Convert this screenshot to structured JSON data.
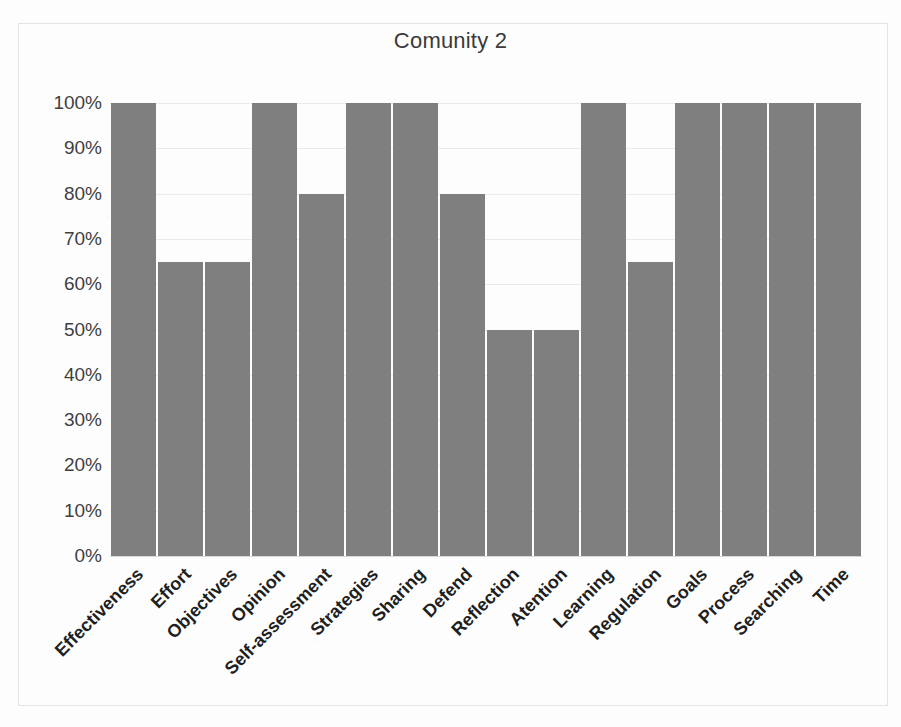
{
  "chart_data": {
    "type": "bar",
    "title": "Comunity 2",
    "xlabel": "",
    "ylabel": "",
    "ylim": [
      0,
      100
    ],
    "grid": true,
    "legend": "none",
    "orientation": "vertical",
    "bar_color": "#7f7f7f",
    "categories": [
      "Effectiveness",
      "Effort",
      "Objectives",
      "Opinion",
      "Self-assessment",
      "Strategies",
      "Sharing",
      "Defend",
      "Reflection",
      "Atention",
      "Learning",
      "Regulation",
      "Goals",
      "Process",
      "Searching",
      "Time"
    ],
    "values": [
      100,
      65,
      65,
      100,
      80,
      100,
      100,
      80,
      50,
      50,
      100,
      65,
      100,
      100,
      100,
      100
    ],
    "value_labels": [
      "100%",
      "65%",
      "65%",
      "100%",
      "80%",
      "100%",
      "100%",
      "80%",
      "50%",
      "50%",
      "100%",
      "65%",
      "100%",
      "100%",
      "100%",
      "100%"
    ],
    "ytick_values": [
      100,
      90,
      80,
      70,
      60,
      50,
      40,
      30,
      20,
      10,
      0
    ],
    "ytick_labels": [
      "100%",
      "90%",
      "80%",
      "70%",
      "60%",
      "50%",
      "40%",
      "30%",
      "20%",
      "10%",
      "0%"
    ]
  }
}
